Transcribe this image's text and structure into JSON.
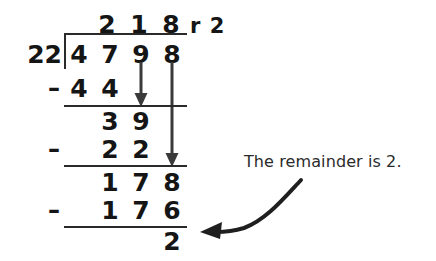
{
  "problem": {
    "dividend": "4798",
    "divisor": "22",
    "quotient": "218",
    "remainder": "2",
    "remainder_prefix": "r"
  },
  "quotient_row": {
    "digits": [
      "2",
      "1",
      "8"
    ],
    "remainder_label": "r 2"
  },
  "dividend_row": {
    "divisor": "22",
    "digits": [
      "4",
      "7",
      "9",
      "8"
    ]
  },
  "steps": [
    {
      "name": "subtract-44",
      "minus": "–",
      "digits": [
        "4",
        "4"
      ],
      "bring_down_icon": "down-arrow-icon"
    },
    {
      "name": "partial-39",
      "digits": [
        "3",
        "9"
      ]
    },
    {
      "name": "subtract-22",
      "minus": "–",
      "digits": [
        "2",
        "2"
      ],
      "bring_down_icon": "down-arrow-icon"
    },
    {
      "name": "partial-178",
      "digits": [
        "1",
        "7",
        "8"
      ]
    },
    {
      "name": "subtract-176",
      "minus": "–",
      "digits": [
        "1",
        "7",
        "6"
      ]
    },
    {
      "name": "final-remainder",
      "digits": [
        "2"
      ]
    }
  ],
  "annotation": {
    "text": "The remainder is 2.",
    "arrow_icon": "curved-arrow-left-icon"
  },
  "colors": {
    "ink": "#151515",
    "rule": "#2a2a2a",
    "arrow": "#3a3a3a",
    "background": "#ffffff"
  }
}
